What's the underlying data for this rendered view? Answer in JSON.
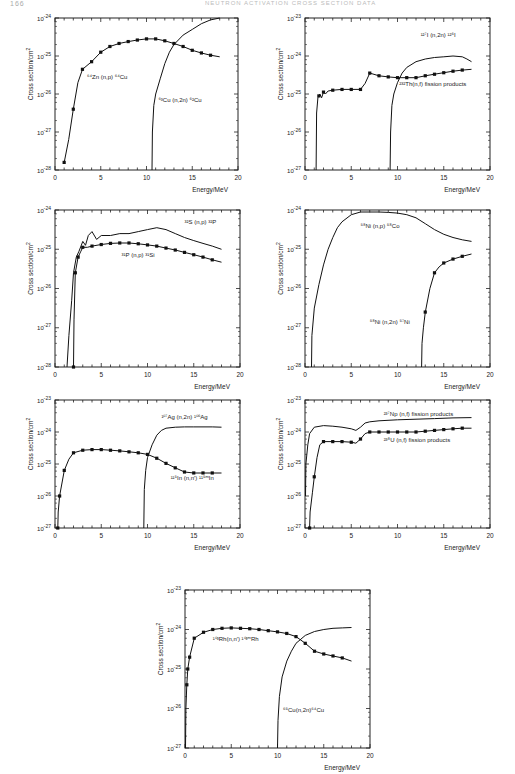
{
  "header": {
    "page_number": "166",
    "running_title": "NEUTRON ACTIVATION CROSS SECTION DATA"
  },
  "chart_data": [
    {
      "id": "p1",
      "type": "line",
      "yscale": "log",
      "box": {
        "x": 55,
        "y": 18,
        "w": 183,
        "h": 152
      },
      "xlim": [
        0,
        20
      ],
      "ylim_exp": [
        -28,
        -24
      ],
      "xticks": [
        0,
        5,
        10,
        15,
        20
      ],
      "ytick_labels": [
        "10^-28",
        "10^-27",
        "10^-26",
        "10^-25",
        "10^-24"
      ],
      "xlabel": "Energy/MeV",
      "ylabel": "Cross section/cm^2",
      "series": [
        {
          "name": "64Zn(n,p)64Cu",
          "markers": true,
          "label": {
            "text": "⁶⁴Zn (n,p) ⁶⁴Cu",
            "x": 3.5,
            "y": -25.6
          },
          "x": [
            1,
            1.5,
            2,
            2.5,
            3,
            4,
            5,
            6,
            7,
            8,
            9,
            10,
            11,
            12,
            13,
            14,
            15,
            16,
            17,
            18
          ],
          "y": [
            -27.8,
            -27.2,
            -26.4,
            -25.7,
            -25.35,
            -25.15,
            -24.9,
            -24.75,
            -24.67,
            -24.62,
            -24.58,
            -24.55,
            -24.55,
            -24.6,
            -24.67,
            -24.75,
            -24.85,
            -24.92,
            -24.98,
            -25.02
          ],
          "mx": [
            1,
            2,
            3,
            4,
            5,
            6,
            7,
            8,
            9,
            10,
            11,
            12,
            13,
            14,
            15,
            16,
            17
          ]
        },
        {
          "name": "63Cu(n,2n)62Cu",
          "markers": false,
          "label": {
            "text": "⁶³Cu (n,2n) ⁶²Cu",
            "x": 11.3,
            "y": -26.2
          },
          "x": [
            10.6,
            10.65,
            10.8,
            11,
            11.5,
            12,
            12.5,
            13,
            14,
            15,
            16,
            17,
            18
          ],
          "y": [
            -28,
            -27,
            -26.3,
            -26,
            -25.6,
            -25.2,
            -24.9,
            -24.7,
            -24.45,
            -24.3,
            -24.15,
            -24.05,
            -24.0
          ]
        }
      ]
    },
    {
      "id": "p2",
      "type": "line",
      "yscale": "log",
      "box": {
        "x": 305,
        "y": 18,
        "w": 185,
        "h": 152
      },
      "xlim": [
        0,
        20
      ],
      "ylim_exp": [
        -27,
        -23
      ],
      "xticks": [
        0,
        5,
        10,
        15,
        20
      ],
      "ytick_labels": [
        "10^-27",
        "10^-26",
        "10^-25",
        "10^-24",
        "10^-23"
      ],
      "xlabel": "Energy/MeV",
      "ylabel": "Cross section/cm^2",
      "series": [
        {
          "name": "127I(n,2n)126I",
          "markers": false,
          "label": {
            "text": "¹²⁷I (n,2n) ¹²⁶I",
            "x": 12.5,
            "y": -23.5
          },
          "x": [
            9.2,
            9.25,
            9.4,
            9.6,
            10,
            10.5,
            11,
            12,
            13,
            14,
            15,
            16,
            17,
            17.5,
            18
          ],
          "y": [
            -27,
            -26,
            -25.3,
            -25,
            -24.7,
            -24.45,
            -24.3,
            -24.15,
            -24.08,
            -24.04,
            -24.02,
            -24.0,
            -24.02,
            -24.08,
            -24.15
          ]
        },
        {
          "name": "232Th(n,f) fission products",
          "markers": true,
          "label": {
            "text": "²³²Th(n,f) fission products",
            "x": 10.2,
            "y": -24.8
          },
          "x": [
            1.2,
            1.25,
            1.4,
            1.6,
            1.8,
            2,
            2.2,
            2.5,
            3,
            4,
            5,
            6,
            6.5,
            7,
            8,
            9,
            10,
            11,
            12,
            13,
            14,
            15,
            16,
            17,
            18
          ],
          "y": [
            -27,
            -25.5,
            -25.1,
            -25.0,
            -25.1,
            -24.95,
            -25.0,
            -24.92,
            -24.9,
            -24.88,
            -24.88,
            -24.88,
            -24.72,
            -24.45,
            -24.52,
            -24.55,
            -24.57,
            -24.57,
            -24.57,
            -24.52,
            -24.48,
            -24.44,
            -24.4,
            -24.37,
            -24.35
          ],
          "mx": [
            1.5,
            2,
            3,
            4,
            5,
            6,
            7,
            8,
            9,
            10,
            11,
            12,
            13,
            14,
            15,
            16,
            17
          ]
        }
      ]
    },
    {
      "id": "p3",
      "type": "line",
      "yscale": "log",
      "box": {
        "x": 55,
        "y": 210,
        "w": 185,
        "h": 157
      },
      "xlim": [
        0,
        20
      ],
      "ylim_exp": [
        -28,
        -24
      ],
      "xticks": [
        0,
        5,
        10,
        15,
        20
      ],
      "ytick_labels": [
        "10^-28",
        "10^-27",
        "10^-26",
        "10^-25",
        "10^-24"
      ],
      "xlabel": "Energy/MeV",
      "ylabel": "Cross section/cm^2",
      "series": [
        {
          "name": "32S(n,p)32P",
          "markers": false,
          "label": {
            "text": "³²S (n,p) ³²P",
            "x": 14,
            "y": -24.35
          },
          "x": [
            1.3,
            1.5,
            1.8,
            2,
            2.3,
            2.6,
            3,
            3.3,
            3.6,
            4,
            4.5,
            5,
            6,
            7,
            8,
            9,
            10,
            11,
            12,
            13,
            14,
            15,
            16,
            17,
            18
          ],
          "y": [
            -28,
            -27.2,
            -26.3,
            -25.6,
            -25.2,
            -25.05,
            -24.8,
            -24.9,
            -24.65,
            -24.55,
            -24.75,
            -24.65,
            -24.65,
            -24.6,
            -24.6,
            -24.55,
            -24.5,
            -24.45,
            -24.5,
            -24.6,
            -24.7,
            -24.78,
            -24.85,
            -24.92,
            -25.0
          ]
        },
        {
          "name": "31P(n,p)31Si",
          "markers": true,
          "label": {
            "text": "³¹P (n,p) ³¹Si",
            "x": 7.2,
            "y": -25.2
          },
          "x": [
            2,
            2.05,
            2.2,
            2.5,
            2.8,
            3,
            3.5,
            4,
            5,
            6,
            7,
            8,
            9,
            10,
            11,
            12,
            13,
            14,
            15,
            16,
            17,
            18
          ],
          "y": [
            -28,
            -26.8,
            -25.6,
            -25.2,
            -25.05,
            -24.95,
            -24.95,
            -24.92,
            -24.88,
            -24.85,
            -24.84,
            -24.84,
            -24.86,
            -24.89,
            -24.92,
            -24.97,
            -25.02,
            -25.08,
            -25.14,
            -25.2,
            -25.27,
            -25.33
          ],
          "mx": [
            2,
            2.2,
            2.5,
            3,
            4,
            5,
            6,
            7,
            8,
            9,
            10,
            11,
            12,
            13,
            14,
            15,
            16,
            17
          ]
        }
      ]
    },
    {
      "id": "p4",
      "type": "line",
      "yscale": "log",
      "box": {
        "x": 305,
        "y": 210,
        "w": 185,
        "h": 157
      },
      "xlim": [
        0,
        20
      ],
      "ylim_exp": [
        -28,
        -24
      ],
      "xticks": [
        0,
        5,
        10,
        15,
        20
      ],
      "ytick_labels": [
        "10^-28",
        "10^-27",
        "10^-26",
        "10^-25",
        "10^-24"
      ],
      "xlabel": "Energy/MeV",
      "ylabel": "Cross section/cm^2",
      "series": [
        {
          "name": "58Ni(n,p)58Co",
          "markers": false,
          "label": {
            "text": "⁵⁸Ni (n,p) ⁵⁸Co",
            "x": 6,
            "y": -24.45
          },
          "x": [
            0.7,
            0.75,
            1,
            1.5,
            2,
            2.5,
            3,
            3.5,
            4,
            5,
            6,
            7,
            8,
            9,
            10,
            11,
            12,
            13,
            14,
            15,
            16,
            17,
            18
          ],
          "y": [
            -28,
            -27.2,
            -26.5,
            -25.9,
            -25.4,
            -25.0,
            -24.7,
            -24.45,
            -24.3,
            -24.12,
            -24.05,
            -24.05,
            -24.05,
            -24.06,
            -24.08,
            -24.12,
            -24.2,
            -24.35,
            -24.5,
            -24.62,
            -24.7,
            -24.76,
            -24.8
          ]
        },
        {
          "name": "58Ni(n,2n)57Ni",
          "markers": true,
          "label": {
            "text": "⁵⁸Ni (n,2n) ⁵⁷Ni",
            "x": 7,
            "y": -26.9
          },
          "x": [
            12.6,
            12.65,
            12.8,
            13,
            13.5,
            14,
            14.5,
            15,
            16,
            17,
            18
          ],
          "y": [
            -28,
            -27.4,
            -27.0,
            -26.6,
            -26.0,
            -25.6,
            -25.45,
            -25.35,
            -25.25,
            -25.18,
            -25.12
          ],
          "mx": [
            13,
            14,
            15,
            16,
            17
          ]
        }
      ]
    },
    {
      "id": "p5",
      "type": "line",
      "yscale": "log",
      "box": {
        "x": 55,
        "y": 400,
        "w": 185,
        "h": 128
      },
      "xlim": [
        0,
        20
      ],
      "ylim_exp": [
        -27,
        -23
      ],
      "xticks": [
        0,
        5,
        10,
        15,
        20
      ],
      "ytick_labels": [
        "10^-27",
        "10^-26",
        "10^-25",
        "10^-24",
        "10^-23"
      ],
      "xlabel": "Energy/MeV",
      "ylabel": "Cross section/cm^2",
      "series": [
        {
          "name": "107Ag(n,2n)106Ag",
          "markers": false,
          "label": {
            "text": "¹⁰⁷Ag (n,2n) ¹⁰⁶Ag",
            "x": 11.5,
            "y": -23.6
          },
          "x": [
            9.6,
            9.65,
            9.8,
            10,
            10.5,
            11,
            11.5,
            12,
            13,
            14,
            15,
            16,
            17,
            18
          ],
          "y": [
            -27,
            -25.8,
            -25.2,
            -24.8,
            -24.4,
            -24.1,
            -23.95,
            -23.88,
            -23.85,
            -23.84,
            -23.84,
            -23.84,
            -23.84,
            -23.85
          ]
        },
        {
          "name": "115In(n,n')115mIn",
          "markers": true,
          "label": {
            "text": "¹¹⁵In (n,n′) ¹¹⁵ᵐIn",
            "x": 12.5,
            "y": -25.5
          },
          "x": [
            0.3,
            0.35,
            0.5,
            1,
            1.5,
            2,
            3,
            4,
            5,
            6,
            7,
            8,
            9,
            10,
            11,
            12,
            13,
            14,
            15,
            16,
            17,
            18
          ],
          "y": [
            -27,
            -26.5,
            -26.0,
            -25.2,
            -24.85,
            -24.65,
            -24.57,
            -24.55,
            -24.55,
            -24.57,
            -24.59,
            -24.62,
            -24.65,
            -24.7,
            -24.82,
            -24.98,
            -25.12,
            -25.25,
            -25.28,
            -25.28,
            -25.28,
            -25.28
          ],
          "mx": [
            0.3,
            0.5,
            1,
            2,
            3,
            4,
            5,
            6,
            7,
            8,
            9,
            10,
            11,
            12,
            13,
            14,
            15,
            16,
            17
          ]
        }
      ]
    },
    {
      "id": "p6",
      "type": "line",
      "yscale": "log",
      "box": {
        "x": 305,
        "y": 400,
        "w": 185,
        "h": 128
      },
      "xlim": [
        0,
        20
      ],
      "ylim_exp": [
        -27,
        -23
      ],
      "xticks": [
        0,
        5,
        10,
        15,
        20
      ],
      "ytick_labels": [
        "10^-27",
        "10^-26",
        "10^-25",
        "10^-24",
        "10^-23"
      ],
      "xlabel": "Energy/MeV",
      "ylabel": "Cross section/cm^2",
      "series": [
        {
          "name": "237Np(n,f) fission products",
          "markers": false,
          "label": {
            "text": "²³⁷Np (n,f) fission products",
            "x": 8.5,
            "y": -23.5
          },
          "x": [
            0.05,
            0.1,
            0.3,
            0.5,
            1,
            2,
            3,
            4,
            5,
            5.5,
            6,
            6.5,
            7,
            8,
            10,
            12,
            14,
            16,
            18
          ],
          "y": [
            -26.0,
            -25.0,
            -24.4,
            -24.05,
            -23.85,
            -23.8,
            -23.82,
            -23.85,
            -23.9,
            -23.95,
            -23.85,
            -23.72,
            -23.68,
            -23.65,
            -23.62,
            -23.6,
            -23.58,
            -23.56,
            -23.55
          ]
        },
        {
          "name": "238U(n,f) fission products",
          "markers": true,
          "label": {
            "text": "²³⁸U (n,f) fission products",
            "x": 8.5,
            "y": -24.3
          },
          "x": [
            0.5,
            0.55,
            0.8,
            1,
            1.3,
            1.6,
            2,
            3,
            4,
            5,
            5.5,
            6,
            6.5,
            7,
            8,
            10,
            12,
            14,
            16,
            17,
            18
          ],
          "y": [
            -27,
            -26.5,
            -25.9,
            -25.4,
            -24.8,
            -24.4,
            -24.3,
            -24.3,
            -24.3,
            -24.32,
            -24.35,
            -24.22,
            -24.05,
            -24.0,
            -24.0,
            -24.0,
            -24.0,
            -23.95,
            -23.9,
            -23.88,
            -23.88
          ],
          "mx": [
            0.5,
            1,
            2,
            3,
            4,
            5,
            6,
            7,
            8,
            9,
            10,
            11,
            12,
            13,
            14,
            15,
            16,
            17
          ]
        }
      ]
    },
    {
      "id": "p7",
      "type": "line",
      "yscale": "log",
      "box": {
        "x": 185,
        "y": 590,
        "w": 185,
        "h": 158
      },
      "xlim": [
        0,
        20
      ],
      "ylim_exp": [
        -27,
        -23
      ],
      "xticks": [
        0,
        5,
        10,
        15,
        20
      ],
      "ytick_labels": [
        "10^-27",
        "10^-26",
        "10^-25",
        "10^-24",
        "10^-23"
      ],
      "xlabel": "Energy/MeV",
      "ylabel": "Cross section/cm^2",
      "series": [
        {
          "name": "103Rh(n,n')103mRh",
          "markers": true,
          "label": {
            "text": "¹⁰³Rh(n,n′) ¹⁰³ᵐRh",
            "x": 3,
            "y": -24.3
          },
          "x": [
            0.05,
            0.1,
            0.2,
            0.3,
            0.5,
            1,
            2,
            3,
            4,
            5,
            6,
            7,
            8,
            9,
            10,
            11,
            12,
            13,
            14,
            15,
            16,
            17,
            18
          ],
          "y": [
            -27,
            -26,
            -25.4,
            -25.0,
            -24.7,
            -24.22,
            -24.07,
            -24.0,
            -23.97,
            -23.96,
            -23.97,
            -23.98,
            -24.0,
            -24.03,
            -24.06,
            -24.1,
            -24.18,
            -24.35,
            -24.55,
            -24.62,
            -24.67,
            -24.72,
            -24.8
          ],
          "mx": [
            0.2,
            0.3,
            0.5,
            1,
            2,
            3,
            4,
            5,
            6,
            7,
            8,
            9,
            10,
            11,
            12,
            13,
            14,
            15,
            16,
            17
          ]
        },
        {
          "name": "65Cu(n,2n)64Cu",
          "markers": false,
          "label": {
            "text": "⁶⁵Cu(n,2n)⁶⁴Cu",
            "x": 10.6,
            "y": -26.1
          },
          "x": [
            10,
            10.05,
            10.2,
            10.5,
            11,
            11.5,
            12,
            13,
            14,
            15,
            16,
            17,
            18
          ],
          "y": [
            -27,
            -26.3,
            -25.7,
            -25.2,
            -24.8,
            -24.55,
            -24.35,
            -24.15,
            -24.05,
            -24.0,
            -23.97,
            -23.96,
            -23.95
          ]
        }
      ]
    }
  ]
}
